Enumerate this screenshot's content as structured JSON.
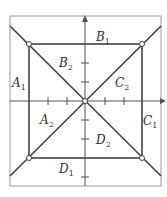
{
  "diagram": {
    "labels": [
      {
        "id": "A1",
        "main": "A",
        "sub": "1",
        "x": 12,
        "y": 77
      },
      {
        "id": "A2",
        "main": "A",
        "sub": "2",
        "x": 40,
        "y": 114
      },
      {
        "id": "B1",
        "main": "B",
        "sub": "1",
        "x": 96,
        "y": 31
      },
      {
        "id": "B2",
        "main": "B",
        "sub": "2",
        "x": 59,
        "y": 57
      },
      {
        "id": "C1",
        "main": "C",
        "sub": "1",
        "x": 143,
        "y": 115
      },
      {
        "id": "C2",
        "main": "C",
        "sub": "2",
        "x": 115,
        "y": 77
      },
      {
        "id": "D1",
        "main": "D",
        "sub": "1",
        "x": 59,
        "y": 163
      },
      {
        "id": "D2",
        "main": "D",
        "sub": "2",
        "x": 96,
        "y": 134
      }
    ],
    "colors": {
      "line": "#444444",
      "frame": "#999999",
      "point_fill": "#ffffff"
    }
  }
}
